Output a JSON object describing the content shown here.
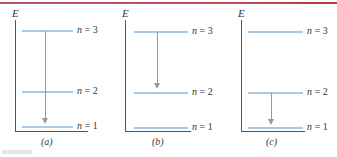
{
  "axis_label": "E",
  "accent_colors": {
    "level_line": "#a9c9e4",
    "top_rule": "#c24a5c",
    "axis": "#555555",
    "arrow": "#999999"
  },
  "panels": [
    {
      "id": "a",
      "label": "(a)",
      "levels": [
        {
          "n": "n = 3",
          "y": 30
        },
        {
          "n": "n = 2",
          "y": 91
        },
        {
          "n": "n = 1",
          "y": 126
        }
      ],
      "transition": {
        "from": "n = 3",
        "to": "n = 1"
      }
    },
    {
      "id": "b",
      "label": "(b)",
      "levels": [
        {
          "n": "n = 3",
          "y": 31
        },
        {
          "n": "n = 2",
          "y": 92
        },
        {
          "n": "n = 1",
          "y": 127
        }
      ],
      "transition": {
        "from": "n = 3",
        "to": "n = 2"
      }
    },
    {
      "id": "c",
      "label": "(c)",
      "levels": [
        {
          "n": "n = 3",
          "y": 31
        },
        {
          "n": "n = 2",
          "y": 92
        },
        {
          "n": "n = 1",
          "y": 127
        }
      ],
      "transition": {
        "from": "n = 2",
        "to": "n = 1"
      }
    }
  ]
}
